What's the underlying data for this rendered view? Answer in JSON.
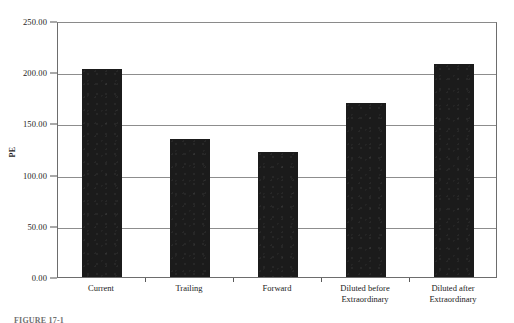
{
  "chart_data": {
    "type": "bar",
    "title": "",
    "subtitle": "",
    "xlabel": "",
    "ylabel": "PE",
    "categories": [
      "Current",
      "Trailing",
      "Forward",
      "Diluted before Extraordinary",
      "Diluted after Extraordinary"
    ],
    "category_lines": [
      [
        "Current"
      ],
      [
        "Trailing"
      ],
      [
        "Forward"
      ],
      [
        "Diluted before",
        "Extraordinary"
      ],
      [
        "Diluted after",
        "Extraordinary"
      ]
    ],
    "values": [
      203,
      135,
      122,
      170,
      208
    ],
    "ylim": [
      0,
      250
    ],
    "ytick_values": [
      0,
      50,
      100,
      150,
      200,
      250
    ],
    "ytick_labels": [
      "0.00",
      "50.00",
      "100.00",
      "150.00",
      "200.00",
      "250.00"
    ],
    "grid": true,
    "grid_axis": "y",
    "legend": false,
    "legend_position": "none",
    "bar_color": "#1b1b1b",
    "gridline_color": "#8d8d8d",
    "axis_color": "#6d6d6d",
    "background_color": "#ffffff"
  },
  "caption": {
    "text": "FIGURE 17-1"
  }
}
